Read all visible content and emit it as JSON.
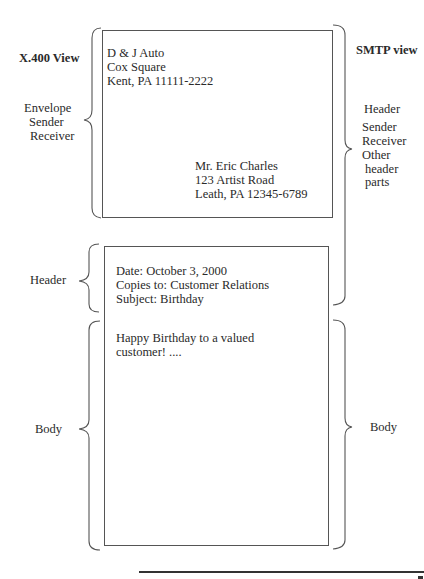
{
  "left_view": {
    "title": "X.400 View",
    "envelope": {
      "label": "Envelope",
      "items": [
        "Sender",
        "Receiver"
      ]
    },
    "header": {
      "label": "Header"
    },
    "body": {
      "label": "Body"
    }
  },
  "right_view": {
    "title": "SMTP view",
    "header": {
      "label": "Header",
      "items": [
        "Sender",
        "Receiver",
        "Other",
        "header",
        "parts"
      ]
    },
    "body": {
      "label": "Body"
    }
  },
  "envelope_box": {
    "sender_address": [
      "D & J Auto",
      "Cox Square",
      "Kent, PA 11111-2222"
    ],
    "recipient_address": [
      "Mr. Eric Charles",
      "123 Artist Road",
      "Leath, PA 12345-6789"
    ]
  },
  "message_box": {
    "header_lines": [
      "Date: October 3, 2000",
      "Copies to: Customer Relations",
      "Subject: Birthday"
    ],
    "body_lines": [
      "Happy Birthday to a valued",
      "customer! ...."
    ]
  },
  "colors": {
    "line": "#555555",
    "text": "#2a2a2a",
    "rule": "#333333"
  }
}
